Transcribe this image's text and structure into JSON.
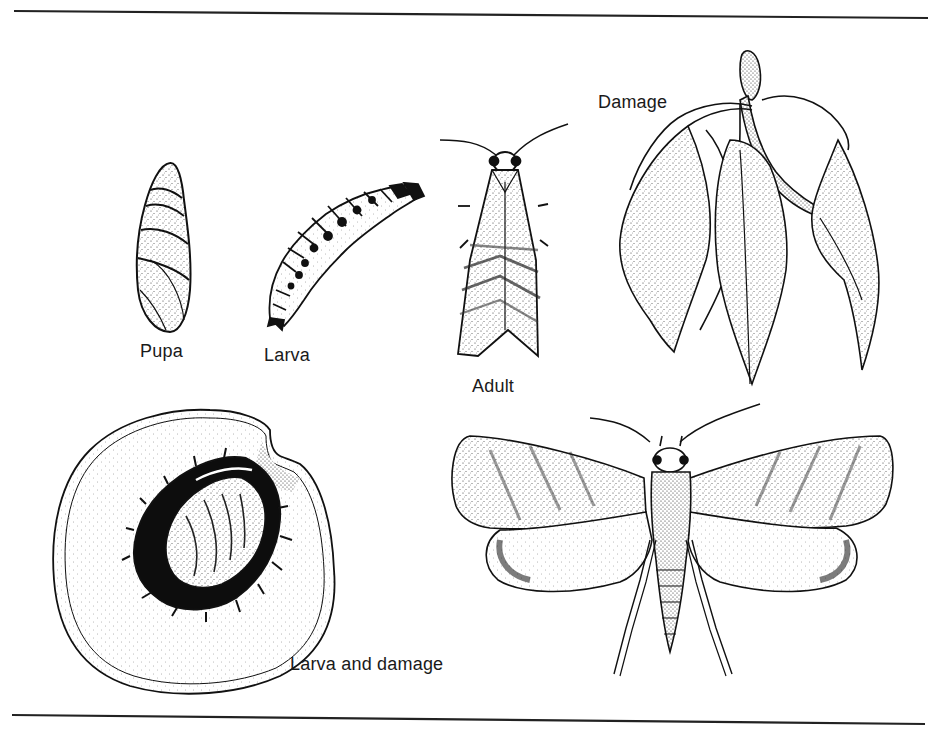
{
  "figure": {
    "background": "#ffffff",
    "ink_color": "#1a1a1a",
    "rules": {
      "top": {
        "x1": 14,
        "y1": 11,
        "x2": 928,
        "y2": 18
      },
      "bottom": {
        "x1": 12,
        "y1": 715,
        "x2": 925,
        "y2": 724
      }
    },
    "panels": [
      {
        "id": "pupa",
        "label": "Pupa",
        "icon": "pupa-illustration"
      },
      {
        "id": "larva",
        "label": "Larva",
        "icon": "larva-illustration"
      },
      {
        "id": "adult-resting",
        "label": "Adult",
        "icon": "moth-resting-illustration"
      },
      {
        "id": "damage",
        "label": "Damage",
        "icon": "wilted-shoot-illustration"
      },
      {
        "id": "larva-and-damage",
        "label": "Larva and damage",
        "icon": "peach-cross-section-illustration"
      },
      {
        "id": "adult-spread",
        "label": "",
        "icon": "moth-spread-wings-illustration"
      }
    ]
  }
}
